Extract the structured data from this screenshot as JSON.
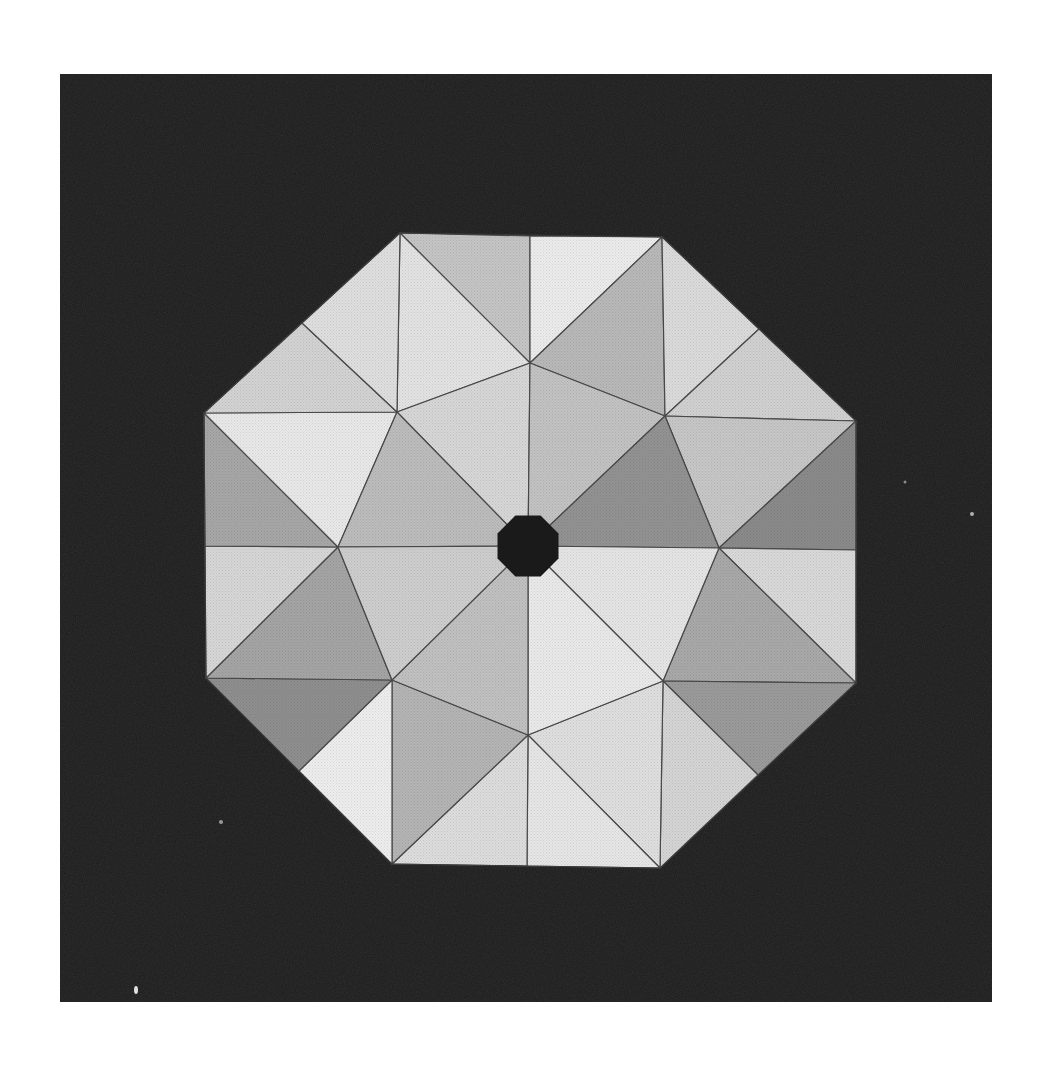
{
  "image": {
    "subject": "octagonal faceted gemstone-like pattern on dark background",
    "background_color": "#ffffff",
    "panel_color": "#1c1c1c",
    "center_color": "#1a1a1a",
    "edge_color": "#4a4a4a",
    "panel": {
      "x": 60,
      "y": 74,
      "w": 932,
      "h": 928
    },
    "center": [
      528,
      546
    ],
    "outer_octagon": [
      [
        400,
        233
      ],
      [
        662,
        237
      ],
      [
        856,
        421
      ],
      [
        856,
        683
      ],
      [
        660,
        868
      ],
      [
        392,
        864
      ],
      [
        206,
        678
      ],
      [
        204,
        413
      ]
    ],
    "mid_points": {
      "top": [
        530,
        236
      ],
      "bottom": [
        527,
        866
      ],
      "left": [
        205,
        546
      ],
      "right": [
        856,
        550
      ],
      "top_left": [
        302,
        323
      ],
      "top_right": [
        759,
        329
      ],
      "bottom_left": [
        299,
        771
      ],
      "bottom_right": [
        758,
        775
      ]
    },
    "inner_ring": [
      [
        530,
        363
      ],
      [
        665,
        416
      ],
      [
        719,
        548
      ],
      [
        663,
        681
      ],
      [
        528,
        735
      ],
      [
        392,
        680
      ],
      [
        338,
        547
      ],
      [
        397,
        412
      ]
    ],
    "center_octagon_radius": 33
  },
  "facets": [
    {
      "id": "t1",
      "pts": [
        [
          400,
          233
        ],
        [
          530,
          236
        ],
        [
          530,
          363
        ]
      ],
      "fill": "#c4c4c4"
    },
    {
      "id": "t2",
      "pts": [
        [
          400,
          233
        ],
        [
          530,
          363
        ],
        [
          397,
          412
        ]
      ],
      "fill": "#e2e2e2"
    },
    {
      "id": "t3",
      "pts": [
        [
          530,
          236
        ],
        [
          662,
          237
        ],
        [
          530,
          363
        ]
      ],
      "fill": "#ebebeb"
    },
    {
      "id": "t4",
      "pts": [
        [
          662,
          237
        ],
        [
          665,
          416
        ],
        [
          530,
          363
        ]
      ],
      "fill": "#b8b8b8"
    },
    {
      "id": "t5",
      "pts": [
        [
          662,
          237
        ],
        [
          759,
          329
        ],
        [
          665,
          416
        ]
      ],
      "fill": "#dadada"
    },
    {
      "id": "t6",
      "pts": [
        [
          759,
          329
        ],
        [
          856,
          421
        ],
        [
          665,
          416
        ]
      ],
      "fill": "#d0d0d0"
    },
    {
      "id": "t7",
      "pts": [
        [
          856,
          421
        ],
        [
          719,
          548
        ],
        [
          665,
          416
        ]
      ],
      "fill": "#c6c6c6"
    },
    {
      "id": "t8",
      "pts": [
        [
          856,
          421
        ],
        [
          856,
          550
        ],
        [
          719,
          548
        ]
      ],
      "fill": "#8a8a8a"
    },
    {
      "id": "t9",
      "pts": [
        [
          856,
          550
        ],
        [
          856,
          683
        ],
        [
          719,
          548
        ]
      ],
      "fill": "#d8d8d8"
    },
    {
      "id": "t10",
      "pts": [
        [
          856,
          683
        ],
        [
          663,
          681
        ],
        [
          719,
          548
        ]
      ],
      "fill": "#a8a8a8"
    },
    {
      "id": "t11",
      "pts": [
        [
          856,
          683
        ],
        [
          758,
          775
        ],
        [
          663,
          681
        ]
      ],
      "fill": "#9a9a9a"
    },
    {
      "id": "t12",
      "pts": [
        [
          758,
          775
        ],
        [
          660,
          868
        ],
        [
          663,
          681
        ]
      ],
      "fill": "#d4d4d4"
    },
    {
      "id": "t13",
      "pts": [
        [
          660,
          868
        ],
        [
          528,
          735
        ],
        [
          663,
          681
        ]
      ],
      "fill": "#dedede"
    },
    {
      "id": "t14",
      "pts": [
        [
          660,
          868
        ],
        [
          527,
          866
        ],
        [
          528,
          735
        ]
      ],
      "fill": "#e6e6e6"
    },
    {
      "id": "t15",
      "pts": [
        [
          527,
          866
        ],
        [
          392,
          864
        ],
        [
          528,
          735
        ]
      ],
      "fill": "#dcdcdc"
    },
    {
      "id": "t16",
      "pts": [
        [
          392,
          864
        ],
        [
          392,
          680
        ],
        [
          528,
          735
        ]
      ],
      "fill": "#b4b4b4"
    },
    {
      "id": "t17",
      "pts": [
        [
          392,
          864
        ],
        [
          299,
          771
        ],
        [
          392,
          680
        ]
      ],
      "fill": "#ededed"
    },
    {
      "id": "t18",
      "pts": [
        [
          299,
          771
        ],
        [
          206,
          678
        ],
        [
          392,
          680
        ]
      ],
      "fill": "#8e8e8e"
    },
    {
      "id": "t19",
      "pts": [
        [
          206,
          678
        ],
        [
          338,
          547
        ],
        [
          392,
          680
        ]
      ],
      "fill": "#a4a4a4"
    },
    {
      "id": "t20",
      "pts": [
        [
          206,
          678
        ],
        [
          205,
          546
        ],
        [
          338,
          547
        ]
      ],
      "fill": "#d6d6d6"
    },
    {
      "id": "t21",
      "pts": [
        [
          205,
          546
        ],
        [
          204,
          413
        ],
        [
          338,
          547
        ]
      ],
      "fill": "#a6a6a6"
    },
    {
      "id": "t22",
      "pts": [
        [
          204,
          413
        ],
        [
          397,
          412
        ],
        [
          338,
          547
        ]
      ],
      "fill": "#e8e8e8"
    },
    {
      "id": "t23",
      "pts": [
        [
          204,
          413
        ],
        [
          302,
          323
        ],
        [
          397,
          412
        ]
      ],
      "fill": "#d2d2d2"
    },
    {
      "id": "t24",
      "pts": [
        [
          302,
          323
        ],
        [
          400,
          233
        ],
        [
          397,
          412
        ]
      ],
      "fill": "#dedede"
    },
    {
      "id": "c1",
      "pts": [
        [
          528,
          546
        ],
        [
          530,
          363
        ],
        [
          397,
          412
        ]
      ],
      "fill": "#d6d6d6"
    },
    {
      "id": "c2",
      "pts": [
        [
          528,
          546
        ],
        [
          397,
          412
        ],
        [
          338,
          547
        ]
      ],
      "fill": "#bcbcbc"
    },
    {
      "id": "c3",
      "pts": [
        [
          528,
          546
        ],
        [
          530,
          363
        ],
        [
          665,
          416
        ]
      ],
      "fill": "#c2c2c2"
    },
    {
      "id": "c4",
      "pts": [
        [
          528,
          546
        ],
        [
          665,
          416
        ],
        [
          719,
          548
        ]
      ],
      "fill": "#929292"
    },
    {
      "id": "c5",
      "pts": [
        [
          528,
          546
        ],
        [
          719,
          548
        ],
        [
          663,
          681
        ]
      ],
      "fill": "#e4e4e4"
    },
    {
      "id": "c6",
      "pts": [
        [
          528,
          546
        ],
        [
          663,
          681
        ],
        [
          528,
          735
        ]
      ],
      "fill": "#e9e9e9"
    },
    {
      "id": "c7",
      "pts": [
        [
          528,
          546
        ],
        [
          528,
          735
        ],
        [
          392,
          680
        ]
      ],
      "fill": "#c0c0c0"
    },
    {
      "id": "c8",
      "pts": [
        [
          528,
          546
        ],
        [
          392,
          680
        ],
        [
          338,
          547
        ]
      ],
      "fill": "#cdcdcd"
    }
  ],
  "marks": [
    {
      "x": 136,
      "y": 990,
      "rx": 2,
      "ry": 4,
      "color": "#e0e0e0"
    },
    {
      "x": 221,
      "y": 822,
      "rx": 2,
      "ry": 2,
      "color": "#9a9a9a"
    },
    {
      "x": 972,
      "y": 514,
      "rx": 2,
      "ry": 2,
      "color": "#b0b0b0"
    },
    {
      "x": 905,
      "y": 482,
      "rx": 1.5,
      "ry": 1.5,
      "color": "#8a8a8a"
    }
  ]
}
